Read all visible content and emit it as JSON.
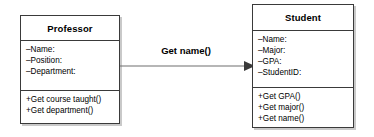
{
  "diagram": {
    "type": "uml-class-diagram",
    "classes": [
      {
        "name": "Professor",
        "attributes": [
          "–Name:",
          "–Position:",
          "–Department:"
        ],
        "methods": [
          "+Get course taught()",
          "+Get department()"
        ]
      },
      {
        "name": "Student",
        "attributes": [
          "–Name:",
          "–Major:",
          "–GPA:",
          "–StudentID:"
        ],
        "methods": [
          "+Get GPA()",
          "+Get major()",
          "+Get name()"
        ]
      }
    ],
    "association": {
      "label": "Get name()",
      "from": "Professor",
      "to": "Student",
      "arrow": "solid-filled-triangle",
      "direction": "right"
    },
    "colors": {
      "box_border": "#3a3a3a",
      "box_fill": "#ffffff",
      "shadow": "#c9c9c9",
      "line": "#6e6e6e",
      "arrowhead": "#3a3a3a",
      "text": "#000000",
      "background": "#ffffff"
    }
  }
}
